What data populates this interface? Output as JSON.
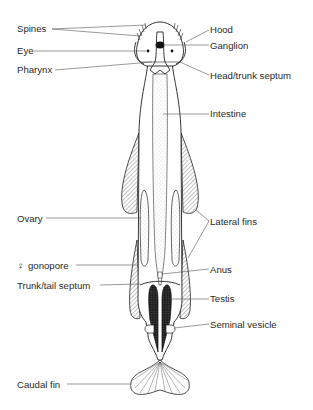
{
  "diagram": {
    "labels": {
      "spines": "Spines",
      "eye": "Eye",
      "pharynx": "Pharynx",
      "hood": "Hood",
      "ganglion": "Ganglion",
      "head_trunk_septum": "Head/trunk septum",
      "intestine": "Intestine",
      "ovary": "Ovary",
      "lateral_fins": "Lateral fins",
      "female_gonopore_symbol": "♀",
      "female_gonopore": "gonopore",
      "anus": "Anus",
      "trunk_tail_septum": "Trunk/tail septum",
      "testis": "Testis",
      "seminal_vesicle": "Seminal vesicle",
      "caudal_fin": "Caudal fin"
    },
    "colors": {
      "line": "#222222",
      "text": "#2a2a2a",
      "background": "#ffffff"
    }
  }
}
